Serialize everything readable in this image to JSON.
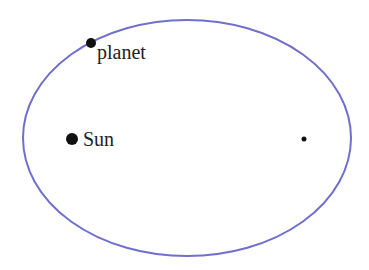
{
  "diagram": {
    "orbit": {
      "cx": 187,
      "cy": 138,
      "rx": 164,
      "ry": 118,
      "color": "#7070cc",
      "stroke_width": 2
    },
    "sun": {
      "label": "Sun",
      "x": 72,
      "y": 139,
      "r": 6,
      "color": "#111111"
    },
    "planet": {
      "label": "planet",
      "x": 91,
      "y": 43,
      "r": 5,
      "color": "#111111"
    },
    "empty_focus": {
      "x": 304,
      "y": 139,
      "r": 2.5,
      "color": "#111111"
    }
  }
}
